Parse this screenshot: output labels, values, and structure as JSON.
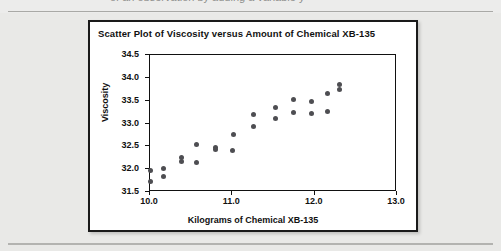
{
  "page": {
    "clipped_top_text": "of an observation by adding a variable y",
    "background_color": "#e9e9e7"
  },
  "figure": {
    "title": "Scatter Plot of Viscosity versus Amount of Chemical XB-135",
    "border_color": "#1a1a1a",
    "background_color": "#ffffff"
  },
  "chart_data": {
    "type": "scatter",
    "title": "Scatter Plot of Viscosity versus Amount of Chemical XB-135",
    "xlabel": "Kilograms of Chemical XB-135",
    "ylabel": "Viscosity",
    "xlim": [
      10.0,
      13.0
    ],
    "ylim": [
      31.5,
      34.5
    ],
    "xticks": [
      10.0,
      11.0,
      12.0,
      13.0
    ],
    "xtick_labels": [
      "10.0",
      "11.0",
      "12.0",
      "13.0"
    ],
    "yticks": [
      31.5,
      32.0,
      32.5,
      33.0,
      33.5,
      34.0,
      34.5
    ],
    "ytick_labels": [
      "31.5",
      "32.0",
      "32.5",
      "33.0",
      "33.5",
      "34.0",
      "34.5"
    ],
    "grid": false,
    "legend": false,
    "marker_color": "#4e4e52",
    "marker_size": 5,
    "series": [
      {
        "name": "Viscosity",
        "points": [
          {
            "x": 10.0,
            "y": 31.96
          },
          {
            "x": 10.0,
            "y": 31.73
          },
          {
            "x": 10.17,
            "y": 32.02
          },
          {
            "x": 10.17,
            "y": 31.84
          },
          {
            "x": 10.38,
            "y": 32.25
          },
          {
            "x": 10.38,
            "y": 32.16
          },
          {
            "x": 10.56,
            "y": 32.54
          },
          {
            "x": 10.56,
            "y": 32.15
          },
          {
            "x": 10.79,
            "y": 32.47
          },
          {
            "x": 10.79,
            "y": 32.44
          },
          {
            "x": 11.0,
            "y": 32.4
          },
          {
            "x": 11.02,
            "y": 32.76
          },
          {
            "x": 11.26,
            "y": 33.19
          },
          {
            "x": 11.26,
            "y": 32.93
          },
          {
            "x": 11.52,
            "y": 33.35
          },
          {
            "x": 11.52,
            "y": 33.11
          },
          {
            "x": 11.74,
            "y": 33.52
          },
          {
            "x": 11.74,
            "y": 33.25
          },
          {
            "x": 11.96,
            "y": 33.48
          },
          {
            "x": 11.96,
            "y": 33.22
          },
          {
            "x": 12.16,
            "y": 33.66
          },
          {
            "x": 12.16,
            "y": 33.27
          },
          {
            "x": 12.3,
            "y": 33.86
          },
          {
            "x": 12.3,
            "y": 33.74
          }
        ]
      }
    ]
  }
}
